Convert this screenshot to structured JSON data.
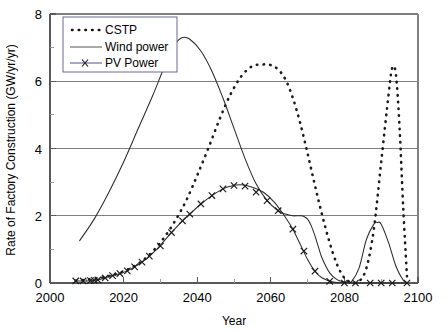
{
  "chart_data": {
    "type": "line",
    "title": "",
    "xlabel": "Year",
    "ylabel": "Rate of Factory Construction (GW/yr/yr)",
    "xlim": [
      2000,
      2100
    ],
    "ylim": [
      0,
      8
    ],
    "xticks": [
      2000,
      2010,
      2020,
      2030,
      2040,
      2050,
      2060,
      2070,
      2080,
      2090,
      2100
    ],
    "xtick_labels": [
      "2000",
      "",
      "2020",
      "",
      "2040",
      "",
      "2060",
      "",
      "2080",
      "",
      "2100"
    ],
    "yticks": [
      0,
      2,
      4,
      6,
      8
    ],
    "ytick_labels": [
      "0",
      "2",
      "4",
      "6",
      "8"
    ],
    "grid": "horizontal-major",
    "legend_position": "upper-left-inside",
    "series": [
      {
        "name": "CSTP",
        "style": "dotted",
        "marker": "none",
        "color": "#1a1a1a",
        "x": [
          2007,
          2010,
          2013,
          2016,
          2019,
          2022,
          2025,
          2028,
          2031,
          2034,
          2037,
          2040,
          2043,
          2046,
          2049,
          2052,
          2055,
          2058,
          2060,
          2062,
          2064,
          2066,
          2068,
          2070,
          2072,
          2074,
          2076,
          2078,
          2080,
          2082,
          2084,
          2086,
          2088,
          2090,
          2092,
          2093,
          2094,
          2095,
          2096,
          2097
        ],
        "y": [
          0.07,
          0.1,
          0.14,
          0.2,
          0.3,
          0.45,
          0.65,
          0.95,
          1.35,
          1.85,
          2.45,
          3.2,
          4.0,
          4.85,
          5.6,
          6.15,
          6.45,
          6.5,
          6.48,
          6.35,
          6.05,
          5.5,
          4.75,
          3.85,
          2.9,
          2.0,
          1.2,
          0.55,
          0.15,
          0.02,
          0.05,
          0.45,
          1.6,
          3.6,
          5.6,
          6.4,
          6.2,
          4.6,
          2.2,
          0.2
        ]
      },
      {
        "name": "Wind power",
        "style": "solid",
        "marker": "none",
        "color": "#2b2b2b",
        "x": [
          2008,
          2012,
          2016,
          2020,
          2024,
          2028,
          2031,
          2034,
          2036,
          2038,
          2041,
          2044,
          2047,
          2050,
          2053,
          2056,
          2059,
          2062,
          2064,
          2066,
          2067,
          2068,
          2069,
          2070,
          2071,
          2072,
          2073,
          2074,
          2076,
          2078,
          2080,
          2081,
          2082,
          2084,
          2086,
          2088,
          2089,
          2090,
          2092,
          2094,
          2096,
          2097
        ],
        "y": [
          1.25,
          1.9,
          2.7,
          3.6,
          4.6,
          5.6,
          6.4,
          7.1,
          7.3,
          7.25,
          6.9,
          6.3,
          5.5,
          4.6,
          3.7,
          2.95,
          2.45,
          2.15,
          2.05,
          2.0,
          2.0,
          2.0,
          1.98,
          1.9,
          1.7,
          1.4,
          1.05,
          0.72,
          0.3,
          0.1,
          0.03,
          0.02,
          0.05,
          0.45,
          1.3,
          1.75,
          1.8,
          1.75,
          1.2,
          0.5,
          0.08,
          0.02
        ]
      },
      {
        "name": "PV Power",
        "style": "solid",
        "marker": "x",
        "color": "#2b2b2b",
        "x": [
          2007,
          2009,
          2011,
          2012,
          2013,
          2015,
          2017,
          2018,
          2019,
          2021,
          2023,
          2025,
          2027,
          2029,
          2031,
          2033,
          2036,
          2038,
          2041,
          2044,
          2047,
          2049,
          2052,
          2055,
          2058,
          2061,
          2064,
          2066,
          2068,
          2070,
          2072,
          2074,
          2077,
          2080,
          2083,
          2086,
          2090,
          2093,
          2097
        ],
        "y": [
          0.06,
          0.06,
          0.07,
          0.08,
          0.09,
          0.15,
          0.22,
          0.25,
          0.28,
          0.36,
          0.48,
          0.62,
          0.8,
          1.0,
          1.25,
          1.5,
          1.85,
          2.05,
          2.35,
          2.6,
          2.8,
          2.88,
          2.92,
          2.85,
          2.7,
          2.4,
          1.95,
          1.6,
          1.15,
          0.7,
          0.35,
          0.15,
          0.03,
          0.01,
          0.0,
          0.0,
          0.0,
          0.0,
          0.0
        ]
      }
    ],
    "pv_markers_x": [
      2007,
      2009,
      2011,
      2012,
      2013,
      2015,
      2017,
      2019,
      2021,
      2023,
      2025,
      2027,
      2030,
      2033,
      2036,
      2038,
      2041,
      2044,
      2047,
      2050,
      2053,
      2056,
      2059,
      2062,
      2066,
      2069,
      2072,
      2076,
      2080,
      2083,
      2087,
      2090,
      2093,
      2097
    ],
    "pv_markers_y": [
      0.06,
      0.06,
      0.07,
      0.08,
      0.09,
      0.15,
      0.22,
      0.28,
      0.36,
      0.48,
      0.62,
      0.8,
      1.1,
      1.5,
      1.85,
      2.05,
      2.35,
      2.6,
      2.8,
      2.9,
      2.88,
      2.7,
      2.45,
      2.15,
      1.6,
      0.95,
      0.35,
      0.05,
      0.0,
      0.0,
      0.0,
      0.0,
      0.0,
      0.0
    ],
    "legend_entries": [
      {
        "label": "CSTP",
        "style": "dotted"
      },
      {
        "label": "Wind power",
        "style": "solid"
      },
      {
        "label": "PV Power",
        "style": "solid-x"
      }
    ]
  }
}
